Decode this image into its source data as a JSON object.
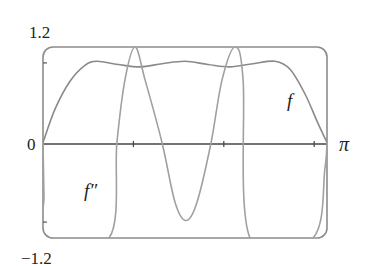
{
  "chart_data": {
    "type": "line",
    "title": "",
    "xlabel": "",
    "ylabel": "",
    "xlim": [
      0,
      3.14159
    ],
    "ylim": [
      -1.2,
      1.2
    ],
    "grid": false,
    "legend": "inline labels",
    "x_tick_labels": [
      "0",
      "π"
    ],
    "x_ticks": [
      1,
      2,
      3
    ],
    "y_tick_labels": [
      "1.2",
      "−1.2"
    ],
    "y_ticks": [
      1,
      -1
    ],
    "series": [
      {
        "name": "f",
        "label": "f",
        "color": "#8a8a8a",
        "x": [
          0,
          0.133,
          0.299,
          0.464,
          0.597,
          0.83,
          1.073,
          1.317,
          1.571,
          1.825,
          2.069,
          2.323,
          2.566,
          2.732,
          2.898,
          3.042,
          3.1416
        ],
        "y": [
          0,
          0.42,
          0.77,
          0.97,
          1.02,
          0.98,
          0.95,
          0.99,
          1.02,
          0.98,
          0.95,
          0.99,
          1.02,
          0.92,
          0.61,
          0.24,
          0
        ]
      },
      {
        "name": "f''",
        "label": "f″",
        "color": "#a0a0a0",
        "x": [
          0,
          0.011,
          0.022,
          0.73,
          0.818,
          0.907,
          1.018,
          1.128,
          1.316,
          1.46,
          1.582,
          1.704,
          1.859,
          1.981,
          2.124,
          2.213,
          2.29,
          2.986,
          3.119,
          3.1416
        ],
        "y": [
          0,
          -0.69,
          -1.2,
          -1.2,
          0,
          0.79,
          1.2,
          0.79,
          0,
          -0.75,
          -0.98,
          -0.75,
          0,
          0.79,
          1.2,
          0.79,
          -1.2,
          -1.2,
          -0.32,
          0
        ]
      }
    ],
    "annotations": [
      {
        "text": "f",
        "series": "f"
      },
      {
        "text": "f″",
        "series": "f''"
      }
    ]
  },
  "labels": {
    "y_top": "1.2",
    "y_bottom": "−1.2",
    "x_origin": "0",
    "x_end": "π",
    "f_label": "f",
    "fpp_label": "f″"
  },
  "colors": {
    "frame": "#8c8c8c",
    "axis": "#444444",
    "text": "#222222"
  }
}
